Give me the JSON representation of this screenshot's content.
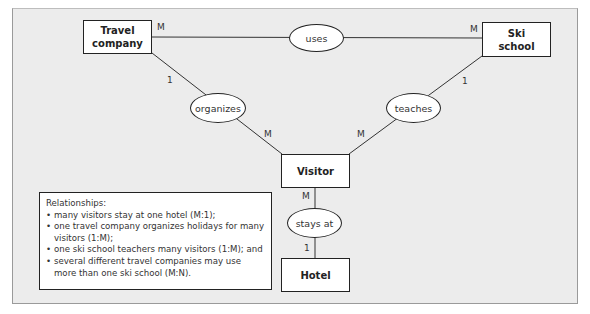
{
  "diagram": {
    "type": "entity-relationship",
    "entities": [
      {
        "id": "travel_company",
        "label": "Travel\ncompany",
        "line1": "Travel",
        "line2": "company"
      },
      {
        "id": "ski_school",
        "label": "Ski\nschool",
        "line1": "Ski",
        "line2": "school"
      },
      {
        "id": "visitor",
        "label": "Visitor"
      },
      {
        "id": "hotel",
        "label": "Hotel"
      }
    ],
    "relationships": [
      {
        "id": "uses",
        "label": "uses",
        "from": "travel_company",
        "to": "ski_school",
        "card_from": "M",
        "card_to": "M"
      },
      {
        "id": "organizes",
        "label": "organizes",
        "from": "travel_company",
        "to": "visitor",
        "card_from": "1",
        "card_to": "M"
      },
      {
        "id": "teaches",
        "label": "teaches",
        "from": "ski_school",
        "to": "visitor",
        "card_from": "1",
        "card_to": "M"
      },
      {
        "id": "stays_at",
        "label": "stays at",
        "from": "visitor",
        "to": "hotel",
        "card_from": "M",
        "card_to": "1"
      }
    ],
    "legend": {
      "title": "Relationships:",
      "items": [
        "many visitors stay at one hotel (M:1);",
        "one travel company organizes holidays for many visitors (1:M);",
        "one ski school teachers many visitors (1:M); and",
        "several different travel companies may use more than one ski school (M:N)."
      ]
    }
  }
}
